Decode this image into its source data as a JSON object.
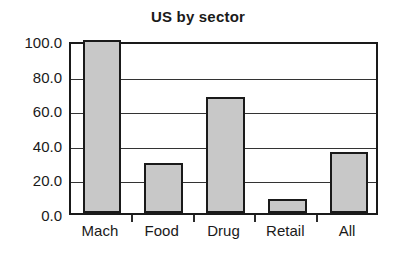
{
  "chart_data": {
    "type": "bar",
    "title": "US by sector",
    "xlabel": "",
    "ylabel": "",
    "categories": [
      "Mach",
      "Food",
      "Drug",
      "Retail",
      "All"
    ],
    "values": [
      100.0,
      29.0,
      67.0,
      8.0,
      35.0
    ],
    "ylim": [
      0.0,
      100.0
    ],
    "yticks": [
      0.0,
      20.0,
      40.0,
      60.0,
      80.0,
      100.0
    ],
    "ytick_labels": [
      "0.0",
      "20.0",
      "40.0",
      "60.0",
      "80.0",
      "100.0"
    ],
    "grid": "horizontal",
    "legend": "none",
    "bar_fill_color": "#c8c8c8",
    "bar_edge_color": "#1a1a1a",
    "axis_color": "#1a1a1a",
    "background_color": "#ffffff"
  }
}
